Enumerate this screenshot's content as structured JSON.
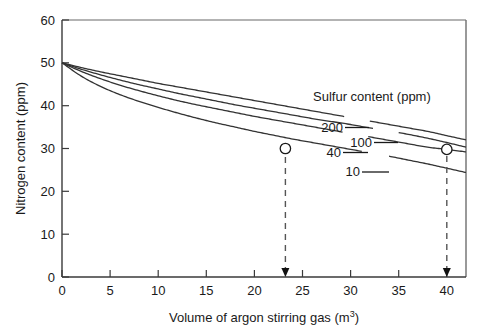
{
  "chart_data": {
    "type": "line",
    "title": "",
    "xlabel": "Volume of argon stirring gas (m3)",
    "xlabel_base": "Volume of argon stirring gas (m",
    "xlabel_sup": "3",
    "xlabel_close": ")",
    "ylabel": "Nitrogen content (ppm)",
    "xlim": [
      0,
      42
    ],
    "ylim": [
      0,
      60
    ],
    "xticks": [
      0,
      5,
      10,
      15,
      20,
      25,
      30,
      35,
      40
    ],
    "yticks": [
      0,
      10,
      20,
      30,
      40,
      50,
      60
    ],
    "grid": false,
    "legend_position": "inline-labels-right",
    "legend_title": "Sulfur content (ppm)",
    "series": [
      {
        "name": "200",
        "label": "200",
        "x": [
          0,
          2,
          4,
          6,
          8,
          10,
          12,
          14,
          16,
          18,
          20,
          22,
          24,
          26,
          28,
          30,
          32,
          34,
          36,
          38,
          40,
          42
        ],
        "values": [
          50.0,
          48.9,
          47.9,
          47.0,
          46.1,
          45.2,
          44.4,
          43.6,
          42.8,
          42.0,
          41.2,
          40.4,
          39.6,
          38.8,
          38.0,
          37.2,
          36.4,
          35.6,
          34.8,
          34.0,
          33.0,
          32.0
        ]
      },
      {
        "name": "100",
        "label": "100",
        "x": [
          0,
          2,
          4,
          6,
          8,
          10,
          12,
          14,
          16,
          18,
          20,
          22,
          24,
          26,
          28,
          30,
          32,
          34,
          36,
          38,
          40,
          42
        ],
        "values": [
          50.0,
          48.5,
          47.2,
          46.0,
          44.9,
          43.9,
          42.9,
          42.0,
          41.1,
          40.2,
          39.4,
          38.6,
          37.8,
          37.0,
          36.3,
          35.6,
          34.8,
          34.1,
          33.3,
          32.4,
          31.4,
          30.3
        ]
      },
      {
        "name": "40",
        "label": "40",
        "x": [
          0,
          2,
          4,
          6,
          8,
          10,
          12,
          14,
          16,
          18,
          20,
          22,
          24,
          26,
          28,
          30,
          32,
          34,
          36,
          38,
          40,
          42
        ],
        "values": [
          50.0,
          48.0,
          46.3,
          44.8,
          43.5,
          42.3,
          41.2,
          40.2,
          39.3,
          38.4,
          37.5,
          36.7,
          35.9,
          35.1,
          34.3,
          33.5,
          32.7,
          31.9,
          31.1,
          30.3,
          29.8,
          29.2
        ]
      },
      {
        "name": "10",
        "label": "10",
        "x": [
          0,
          2,
          4,
          6,
          8,
          10,
          12,
          14,
          16,
          18,
          20,
          22,
          24,
          26,
          28,
          30,
          32,
          34,
          36,
          38,
          40,
          42
        ],
        "values": [
          50.0,
          46.9,
          44.5,
          42.6,
          41.0,
          39.6,
          38.3,
          37.1,
          36.0,
          35.0,
          34.0,
          33.1,
          32.2,
          31.4,
          30.6,
          29.8,
          29.0,
          28.2,
          27.3,
          26.4,
          25.4,
          24.4
        ]
      }
    ],
    "annotations": [
      {
        "name": "marker-left",
        "x": 22.3,
        "y": 30.0,
        "marker": "open-circle",
        "dropline": "dashed-arrow"
      },
      {
        "name": "marker-right",
        "x": 40.0,
        "y": 29.8,
        "marker": "open-circle",
        "dropline": "dashed-arrow"
      }
    ],
    "colors": {
      "curve": "#333333",
      "axis": "#888888",
      "text": "#1a1a1a",
      "dashed": "#555555",
      "marker_fill": "#ffffff"
    }
  }
}
